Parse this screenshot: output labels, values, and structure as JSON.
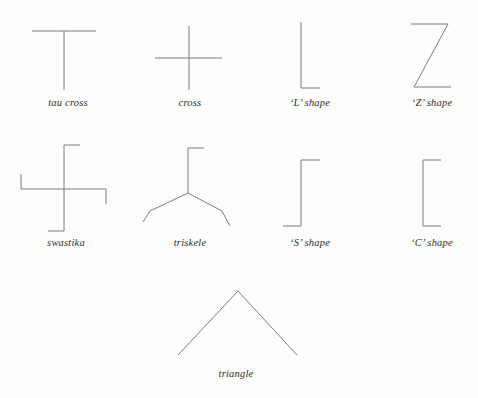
{
  "plate": {
    "background_color": "#fdfdfc",
    "stroke_color": "#7d7d7d",
    "caption_color": "#2e2e2e",
    "stroke_width": 1
  },
  "figures": [
    {
      "id": "tau-cross",
      "label": "tau cross",
      "caption_x": 68,
      "caption_y": 104,
      "row": 1,
      "column": 1
    },
    {
      "id": "cross",
      "label": "cross",
      "caption_x": 190,
      "caption_y": 104,
      "row": 1,
      "column": 2
    },
    {
      "id": "l-shape",
      "label": "‘L’ shape",
      "caption_x": 310,
      "caption_y": 104,
      "row": 1,
      "column": 3
    },
    {
      "id": "z-shape",
      "label": "‘Z’ shape",
      "caption_x": 432,
      "caption_y": 104,
      "row": 1,
      "column": 4
    },
    {
      "id": "swastika",
      "label": "swastika",
      "caption_x": 66,
      "caption_y": 244,
      "row": 2,
      "column": 1
    },
    {
      "id": "triskele",
      "label": "triskele",
      "caption_x": 190,
      "caption_y": 244,
      "row": 2,
      "column": 2
    },
    {
      "id": "s-shape",
      "label": "‘S’ shape",
      "caption_x": 310,
      "caption_y": 244,
      "row": 2,
      "column": 3
    },
    {
      "id": "c-shape",
      "label": "‘C’ shape",
      "caption_x": 432,
      "caption_y": 244,
      "row": 2,
      "column": 4
    },
    {
      "id": "triangle",
      "label": "triangle",
      "caption_x": 236,
      "caption_y": 375,
      "row": 3,
      "column": 2
    }
  ]
}
